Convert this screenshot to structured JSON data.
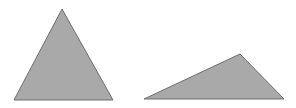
{
  "diagram": {
    "background": "#ffffff",
    "fill": "#a9a9a9",
    "stroke": "#6e6e6e",
    "shapes": [
      {
        "name": "acute-triangle",
        "points": "62,9 14,100 113,100"
      },
      {
        "name": "obtuse-triangle",
        "points": "144,99 240,54 284,99"
      }
    ]
  }
}
